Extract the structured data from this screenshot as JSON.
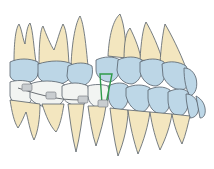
{
  "illustration": {
    "subject": "Dental arch illustration with orthodontic brackets and archwire, lateral view",
    "colors": {
      "background": "#ffffff",
      "root": "#f3e6bf",
      "root_shade": "#e6d3a0",
      "crown_upper": "#bcd6e6",
      "crown_lower": "#bdd7e7",
      "crown_shade": "#a6c4d8",
      "outline": "#55606a",
      "bracket": "#8a8f94",
      "wire": "#6b7075",
      "green_loop": "#2f9a4a",
      "lower_white_crowns": "#f2f4f2"
    }
  }
}
